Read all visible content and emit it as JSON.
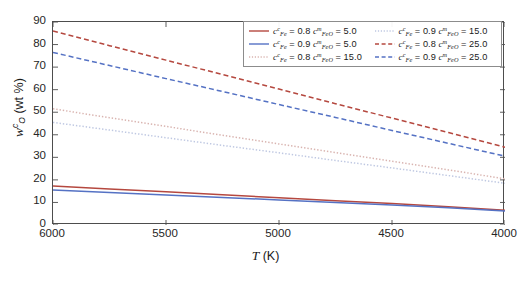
{
  "chart_data": {
    "type": "line",
    "title": "",
    "xlabel": "T (K)",
    "ylabel": "w_O^c (wt %)",
    "xlim": [
      6000,
      4000
    ],
    "ylim": [
      0,
      90
    ],
    "x_ticks": [
      "6000",
      "5500",
      "5000",
      "4500",
      "4000"
    ],
    "x_tick_values": [
      6000,
      5500,
      5000,
      4500,
      4000
    ],
    "y_ticks": [
      "0",
      "10",
      "20",
      "30",
      "40",
      "50",
      "60",
      "70",
      "80",
      "90"
    ],
    "y_tick_values": [
      0,
      10,
      20,
      30,
      40,
      50,
      60,
      70,
      80,
      90
    ],
    "x_reversed": true,
    "grid": false,
    "legend_position": "top-right",
    "x": [
      6000,
      5750,
      5500,
      5250,
      5000,
      4750,
      4500,
      4250,
      4000
    ],
    "series": [
      {
        "name": "c_Fe^c = 0.8  c_FeO^m = 5.0",
        "cFe": "0.8",
        "cFeO": "5.0",
        "color": "#b5483f",
        "style": "solid",
        "values": [
          17.3,
          16.0,
          14.7,
          13.4,
          12.1,
          10.8,
          9.5,
          8.1,
          6.5
        ]
      },
      {
        "name": "c_Fe^c = 0.9  c_FeO^m = 5.0",
        "cFe": "0.9",
        "cFeO": "5.0",
        "color": "#5572c4",
        "style": "solid",
        "values": [
          15.5,
          14.4,
          13.3,
          12.2,
          11.1,
          10.0,
          8.9,
          7.7,
          6.2
        ]
      },
      {
        "name": "c_Fe^c = 0.8  c_FeO^m = 15.0",
        "cFe": "0.8",
        "cFeO": "15.0",
        "color": "#d9b4b0",
        "style": "dotted",
        "values": [
          51.5,
          47.6,
          43.7,
          39.8,
          35.9,
          32.1,
          28.3,
          24.4,
          20.5
        ]
      },
      {
        "name": "c_Fe^c = 0.9  c_FeO^m = 15.0",
        "cFe": "0.9",
        "cFeO": "15.0",
        "color": "#bfc8e2",
        "style": "dotted",
        "values": [
          45.5,
          42.1,
          38.7,
          35.3,
          32.0,
          28.6,
          25.3,
          21.9,
          18.5
        ]
      },
      {
        "name": "c_Fe^c = 0.8  c_FeO^m = 25.0",
        "cFe": "0.8",
        "cFeO": "25.0",
        "color": "#b5483f",
        "style": "dashed",
        "values": [
          86.0,
          79.5,
          73.1,
          66.7,
          60.3,
          53.8,
          47.4,
          41.0,
          34.5
        ]
      },
      {
        "name": "c_Fe^c = 0.9  c_FeO^m = 25.0",
        "cFe": "0.9",
        "cFeO": "25.0",
        "color": "#5572c4",
        "style": "dashed",
        "values": [
          76.5,
          70.7,
          64.9,
          59.2,
          53.4,
          47.7,
          41.9,
          36.2,
          30.5
        ]
      }
    ],
    "legend": {
      "columns": [
        [
          {
            "cFe": "0.8",
            "cFeO": "5.0",
            "color": "#b5483f",
            "style": "solid"
          },
          {
            "cFe": "0.9",
            "cFeO": "5.0",
            "color": "#5572c4",
            "style": "solid"
          },
          {
            "cFe": "0.8",
            "cFeO": "15.0",
            "color": "#d9b4b0",
            "style": "dotted"
          }
        ],
        [
          {
            "cFe": "0.9",
            "cFeO": "15.0",
            "color": "#bfc8e2",
            "style": "dotted"
          },
          {
            "cFe": "0.8",
            "cFeO": "25.0",
            "color": "#b5483f",
            "style": "dashed"
          },
          {
            "cFe": "0.9",
            "cFeO": "25.0",
            "color": "#5572c4",
            "style": "dashed"
          }
        ]
      ]
    }
  },
  "axis": {
    "x_title_symbol": "T",
    "x_title_unit": "(K)",
    "y_title_symbol": "w",
    "y_title_sub": "O",
    "y_title_sup": "c",
    "y_title_unit": "(wt %)"
  },
  "colors": {
    "red": "#b5483f",
    "blue": "#5572c4",
    "light_red": "#d9b4b0",
    "light_blue": "#bfc8e2",
    "axis": "#4d4d4d",
    "text": "#262626",
    "legend_border": "#8c8c8c"
  }
}
